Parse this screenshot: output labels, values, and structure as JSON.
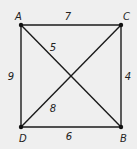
{
  "diagram": {
    "type": "weighted-graph",
    "nodes": [
      {
        "id": "A",
        "label": "A",
        "position": "top-left"
      },
      {
        "id": "C",
        "label": "C",
        "position": "top-right"
      },
      {
        "id": "B",
        "label": "B",
        "position": "bottom-right"
      },
      {
        "id": "D",
        "label": "D",
        "position": "bottom-left"
      }
    ],
    "edges": [
      {
        "from": "A",
        "to": "C",
        "weight": "7"
      },
      {
        "from": "C",
        "to": "B",
        "weight": "4"
      },
      {
        "from": "D",
        "to": "B",
        "weight": "6"
      },
      {
        "from": "A",
        "to": "D",
        "weight": "9"
      },
      {
        "from": "A",
        "to": "B",
        "weight": "5"
      },
      {
        "from": "D",
        "to": "C",
        "weight": "8"
      }
    ]
  }
}
